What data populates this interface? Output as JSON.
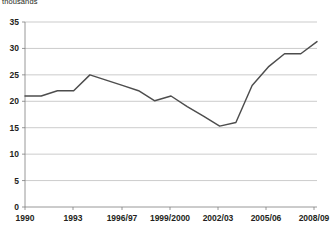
{
  "units_label": "thousands",
  "chart_data": {
    "type": "line",
    "title": "",
    "subtitle": "",
    "xlabel": "",
    "ylabel": "thousands",
    "ylim": [
      0,
      35
    ],
    "yticks": [
      0,
      5,
      10,
      15,
      20,
      25,
      30,
      35
    ],
    "ytick_labels": [
      "0",
      "5",
      "10",
      "15",
      "20",
      "25",
      "30",
      "35"
    ],
    "xtick_labels": [
      "1990",
      "1993",
      "1996/97",
      "1999/2000",
      "2002/03",
      "2005/06",
      "2008/09"
    ],
    "grid": true,
    "legend": false,
    "legend_position": "none",
    "x": [
      "1990",
      "1991",
      "1992",
      "1993",
      "1994",
      "1995/96",
      "1996/97",
      "1997/98",
      "1998/99",
      "1999/2000",
      "2000/01",
      "2001/02",
      "2002/03",
      "2003/04",
      "2004/05",
      "2005/06",
      "2006/07",
      "2007/08",
      "2008/09"
    ],
    "series": [
      {
        "name": "thousands",
        "color": "#4d4d4d",
        "values": [
          21.0,
          21.0,
          22.0,
          22.0,
          25.0,
          24.0,
          23.0,
          22.0,
          20.1,
          21.0,
          19.0,
          17.2,
          15.3,
          16.0,
          23.0,
          26.5,
          29.0,
          29.0,
          31.3
        ]
      }
    ]
  },
  "geometry": {
    "plot_left": 25,
    "plot_right": 317,
    "plot_top": 22,
    "plot_bottom": 207,
    "tick_x": [
      25,
      73,
      122,
      170,
      218,
      266,
      314
    ]
  }
}
